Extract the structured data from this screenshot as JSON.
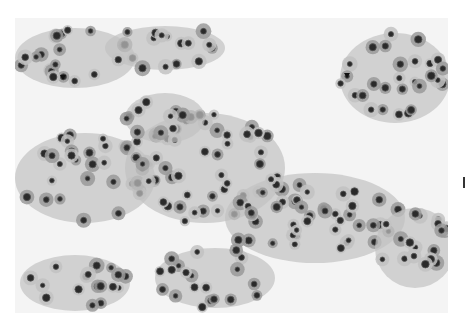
{
  "figure": {
    "type": "histology-micrograph",
    "colormode": "grayscale",
    "frame": {
      "x": 15,
      "y": 18,
      "width": 433,
      "height": 295
    },
    "colors": {
      "background": "#f4f4f4",
      "cytoplasm": "#9a9a9a",
      "cytoplasm_light": "#c2c2c2",
      "nucleus": "#2a2a2a",
      "nucleus_rim": "#555555",
      "arrow": "#111111"
    },
    "tissue_regions": [
      {
        "cx": 60,
        "cy": 40,
        "rx": 60,
        "ry": 30
      },
      {
        "cx": 150,
        "cy": 30,
        "rx": 60,
        "ry": 22
      },
      {
        "cx": 380,
        "cy": 60,
        "rx": 55,
        "ry": 45
      },
      {
        "cx": 70,
        "cy": 160,
        "rx": 70,
        "ry": 45
      },
      {
        "cx": 190,
        "cy": 150,
        "rx": 80,
        "ry": 55
      },
      {
        "cx": 300,
        "cy": 200,
        "rx": 90,
        "ry": 45
      },
      {
        "cx": 400,
        "cy": 230,
        "rx": 40,
        "ry": 40
      },
      {
        "cx": 60,
        "cy": 265,
        "rx": 55,
        "ry": 28
      },
      {
        "cx": 200,
        "cy": 260,
        "rx": 60,
        "ry": 30
      },
      {
        "cx": 150,
        "cy": 100,
        "rx": 40,
        "ry": 25
      }
    ],
    "arrowheads": [
      {
        "label": "arrowhead-left",
        "x": 45,
        "y": 57
      },
      {
        "label": "arrowhead-right",
        "x": 329,
        "y": 55
      }
    ],
    "edge_tick": {
      "x": 463,
      "y": 177
    }
  }
}
